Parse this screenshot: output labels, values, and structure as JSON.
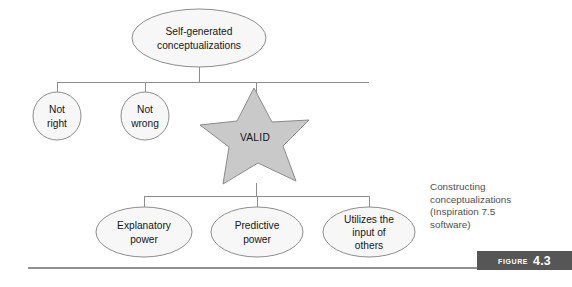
{
  "figure": {
    "caption_lines": [
      "Constructing",
      "conceptualizations",
      "(Inspiration 7.5",
      "software)"
    ],
    "badge_word": "Figure",
    "badge_number": "4.3"
  },
  "diagram": {
    "root": {
      "id": "self-generated-conceptualizations",
      "label_line_1": "Self-generated",
      "label_line_2": "conceptualizations",
      "shape": "ellipse",
      "cx": 199,
      "cy": 38,
      "rx": 67,
      "ry": 29
    },
    "level_two": [
      {
        "id": "not-right",
        "label_line_1": "Not",
        "label_line_2": "right",
        "shape": "circle",
        "cx": 57,
        "cy": 116,
        "r": 24
      },
      {
        "id": "not-wrong",
        "label_line_1": "Not",
        "label_line_2": "wrong",
        "shape": "circle",
        "cx": 145,
        "cy": 116,
        "r": 24
      },
      {
        "id": "valid",
        "label_line_1": "VALID",
        "label_line_2": "",
        "shape": "star",
        "cx": 256,
        "cy": 138,
        "r_outer": 51,
        "r_inner": 21
      }
    ],
    "level_three": [
      {
        "id": "explanatory-power",
        "label_line_1": "Explanatory",
        "label_line_2": "power",
        "label_line_3": "",
        "shape": "ellipse",
        "cx": 144,
        "cy": 232,
        "rx": 48,
        "ry": 25
      },
      {
        "id": "predictive-power",
        "label_line_1": "Predictive",
        "label_line_2": "power",
        "label_line_3": "",
        "shape": "ellipse",
        "cx": 257,
        "cy": 232,
        "rx": 46,
        "ry": 25
      },
      {
        "id": "utilizes-input-of-others",
        "label_line_1": "Utilizes the",
        "label_line_2": "input of",
        "label_line_3": "others",
        "shape": "ellipse",
        "cx": 369,
        "cy": 232,
        "rx": 46,
        "ry": 25
      }
    ],
    "connectors": {
      "root_stem": "M199,67 L199,82",
      "upper_bus": "M57,82 L369,82",
      "upper_drop_not_right": "M57,82 L57,92",
      "upper_drop_not_wrong": "M145,82 L145,92",
      "upper_drop_valid": "M256,82 L256,92",
      "valid_stem": "M256,185 L256,196",
      "lower_bus": "M144,196 L369,196",
      "lower_drop_explanatory": "M144,196 L144,207",
      "lower_drop_predictive": "M257,196 L257,207",
      "lower_drop_utilizes": "M369,196 L369,207"
    },
    "bottom_rule": {
      "x1": 28,
      "y1": 268,
      "x2": 556,
      "y2": 268
    }
  },
  "colors": {
    "shape_fill_light": "#f7f7f7",
    "star_fill": "#c9c9c9",
    "stroke": "#8d8d8d",
    "badge_bg": "#565656",
    "badge_text": "#ffffff",
    "caption_text": "#4f4f4f",
    "background": "#ffffff"
  }
}
